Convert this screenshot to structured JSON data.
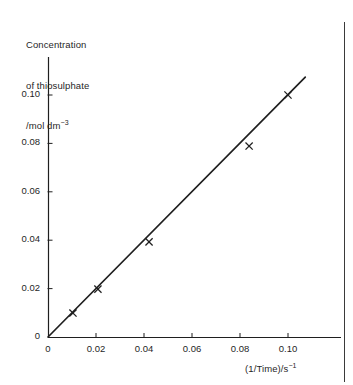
{
  "figure": {
    "background_color": "#ffffff",
    "ink_color": "#1f1f1f",
    "page_rule_color": "#3a3a3a"
  },
  "y_axis_title": {
    "line1": "Concentration",
    "line2": "of thiosulphate",
    "line3_base": "/mol dm",
    "line3_exponent": "−3"
  },
  "x_axis_title": {
    "base": "(1/Time)/s",
    "exponent": "−1"
  },
  "chart_data": {
    "type": "scatter",
    "title": "",
    "subtitle": "",
    "xlabel": "(1/Time)/s−1",
    "ylabel": "Concentration of thiosulphate /mol dm−3",
    "xlim": [
      0,
      0.113
    ],
    "ylim": [
      0,
      0.1125
    ],
    "grid": false,
    "legend": false,
    "legend_position": "none",
    "x_ticks": [
      0,
      0.02,
      0.04,
      0.06,
      0.08,
      0.1
    ],
    "x_tick_labels": [
      "0",
      "0.02",
      "0.04",
      "0.06",
      "0.08",
      "0.10"
    ],
    "y_ticks": [
      0,
      0.02,
      0.04,
      0.06,
      0.08,
      0.1
    ],
    "y_tick_labels": [
      "0",
      "0.02",
      "0.04",
      "0.06",
      "0.08",
      "0.10"
    ],
    "marker": "x",
    "points": [
      {
        "x": 0.0104,
        "y": 0.0099
      },
      {
        "x": 0.0208,
        "y": 0.0198
      },
      {
        "x": 0.0421,
        "y": 0.0393
      },
      {
        "x": 0.0838,
        "y": 0.0789
      },
      {
        "x": 0.1,
        "y": 0.1
      }
    ],
    "series": [
      {
        "name": "Concentration of thiosulphate",
        "x": [
          0.0104,
          0.0208,
          0.0421,
          0.0838,
          0.1
        ],
        "values": [
          0.0099,
          0.0198,
          0.0393,
          0.0789,
          0.1
        ]
      }
    ],
    "fit_line": {
      "type": "line",
      "through_origin": true,
      "x_start": 0.0,
      "y_start": 0.0,
      "x_end": 0.1072,
      "y_end": 0.1074,
      "slope": 1.0
    }
  }
}
